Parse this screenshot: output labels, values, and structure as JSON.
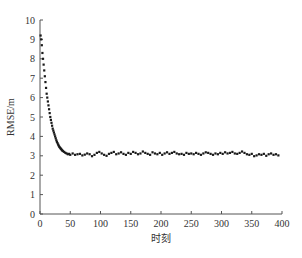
{
  "chart_data": {
    "type": "scatter",
    "title": "",
    "xlabel": "时刻",
    "ylabel": "RMSE/m",
    "xlim": [
      0,
      400
    ],
    "ylim": [
      0,
      10
    ],
    "xticks": [
      0,
      50,
      100,
      150,
      200,
      250,
      300,
      350,
      400
    ],
    "yticks": [
      0,
      1,
      2,
      3,
      4,
      5,
      6,
      7,
      8,
      9,
      10
    ],
    "grid": false,
    "legend": null,
    "marker_color": "#1a1a1a",
    "series": [
      {
        "name": "RMSE",
        "x": [
          1,
          2,
          3,
          4,
          5,
          6,
          7,
          8,
          9,
          10,
          11,
          12,
          13,
          14,
          15,
          16,
          17,
          18,
          19,
          20,
          21,
          22,
          23,
          24,
          25,
          26,
          27,
          28,
          29,
          30,
          31,
          32,
          33,
          34,
          35,
          36,
          37,
          38,
          40,
          42,
          44,
          46,
          48,
          50,
          54,
          58,
          62,
          66,
          70,
          74,
          78,
          82,
          86,
          90,
          94,
          98,
          102,
          106,
          110,
          114,
          118,
          122,
          126,
          130,
          134,
          138,
          142,
          146,
          150,
          154,
          158,
          162,
          166,
          170,
          174,
          178,
          182,
          186,
          190,
          194,
          198,
          202,
          206,
          210,
          214,
          218,
          222,
          226,
          230,
          234,
          238,
          242,
          246,
          250,
          254,
          258,
          262,
          266,
          270,
          274,
          278,
          282,
          286,
          290,
          294,
          298,
          302,
          306,
          310,
          314,
          318,
          322,
          326,
          330,
          334,
          338,
          342,
          346,
          350,
          354,
          358,
          362,
          366,
          370,
          374,
          378,
          382,
          386,
          390,
          394
        ],
        "y": [
          9.2,
          9.0,
          8.7,
          8.3,
          8.0,
          7.7,
          7.4,
          7.1,
          6.8,
          6.5,
          6.2,
          6.0,
          5.8,
          5.6,
          5.4,
          5.2,
          5.0,
          4.85,
          4.7,
          4.55,
          4.4,
          4.3,
          4.2,
          4.1,
          4.0,
          3.9,
          3.8,
          3.72,
          3.65,
          3.58,
          3.52,
          3.46,
          3.42,
          3.38,
          3.35,
          3.3,
          3.27,
          3.24,
          3.2,
          3.15,
          3.12,
          3.08,
          3.1,
          3.05,
          3.12,
          3.05,
          3.08,
          3.1,
          3.02,
          3.06,
          3.12,
          3.08,
          2.98,
          3.05,
          3.15,
          3.2,
          3.12,
          3.05,
          3.0,
          3.1,
          3.15,
          3.2,
          3.08,
          3.12,
          3.18,
          3.1,
          3.05,
          3.15,
          3.1,
          3.2,
          3.15,
          3.08,
          3.12,
          3.22,
          3.15,
          3.1,
          3.05,
          3.18,
          3.12,
          3.08,
          3.15,
          3.05,
          3.12,
          3.18,
          3.1,
          3.15,
          3.2,
          3.12,
          3.08,
          3.1,
          3.05,
          3.15,
          3.1,
          3.12,
          3.08,
          3.15,
          3.1,
          3.05,
          3.12,
          3.18,
          3.15,
          3.1,
          3.05,
          3.12,
          3.08,
          3.15,
          3.1,
          3.18,
          3.12,
          3.15,
          3.2,
          3.12,
          3.1,
          3.15,
          3.22,
          3.15,
          3.08,
          3.05,
          3.1,
          2.98,
          3.02,
          3.08,
          3.05,
          3.1,
          3.0,
          3.08,
          3.12,
          3.05,
          3.08,
          3.02
        ]
      }
    ]
  }
}
